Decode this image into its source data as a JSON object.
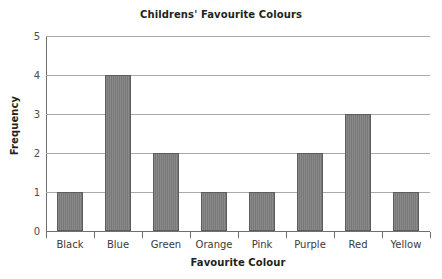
{
  "chart_data": {
    "type": "bar",
    "title": "Childrens' Favourite Colours",
    "xlabel": "Favourite Colour",
    "ylabel": "Frequency",
    "categories": [
      "Black",
      "Blue",
      "Green",
      "Orange",
      "Pink",
      "Purple",
      "Red",
      "Yellow"
    ],
    "values": [
      1,
      4,
      2,
      1,
      1,
      2,
      3,
      1
    ],
    "ylim": [
      0,
      5
    ],
    "yticks": [
      0,
      1,
      2,
      3,
      4,
      5
    ],
    "ytick_labels": [
      "0",
      "1",
      "2",
      "3",
      "4",
      "5"
    ],
    "grid": true,
    "legend": false,
    "bar_color": "#7d7d7d",
    "bar_border_color": "#5c5c5c",
    "gridline_color": "#a9a9a9",
    "axis_color": "#6f6f6f",
    "background_color": "#ffffff",
    "text_color": "#231f20"
  }
}
